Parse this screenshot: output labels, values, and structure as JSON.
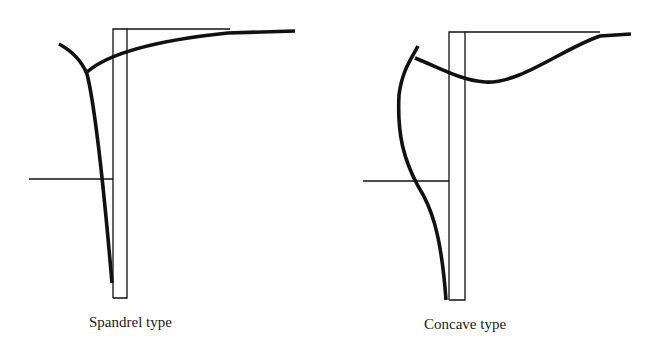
{
  "figures": [
    {
      "id": "spandrel",
      "caption": "Spandrel type"
    },
    {
      "id": "concave",
      "caption": "Concave type"
    }
  ],
  "colors": {
    "line": "#111111",
    "background": "#ffffff"
  }
}
